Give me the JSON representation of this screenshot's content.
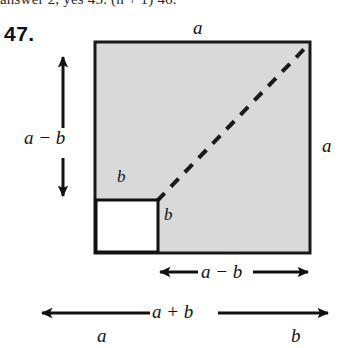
{
  "page": {
    "truncated_top_line": "answer 2, yes    45. (n + 1)     46.",
    "problem_number": "47."
  },
  "figure": {
    "title_top_label": "a",
    "right_label": "a",
    "left_vertical_label": "a − b",
    "inner_label_above_square": "b",
    "inner_label_right_of_square": "b",
    "bottom_inner_label": "a − b",
    "bottom_outer_label": "a + b",
    "bottom_segment_left_label": "a",
    "bottom_segment_right_label": "b",
    "colors": {
      "shaded_square_fill": "#d9d9d9",
      "shaded_square_stroke": "#1a1a1a",
      "inner_square_fill": "#ffffff",
      "inner_square_stroke": "#111111",
      "diagonal_dashed_stroke": "#1a1a1a",
      "arrow_stroke": "#101010",
      "text": "#111111"
    },
    "geometry": {
      "big_square": {
        "x": 95,
        "y": 42,
        "width": 215,
        "height": 211
      },
      "inner_white_square": {
        "x": 95,
        "y": 200,
        "width": 63,
        "height": 53
      },
      "diagonal": {
        "x1": 158,
        "y1": 200,
        "x2": 310,
        "y2": 42
      }
    },
    "icon_names": [
      "arrow-up-icon",
      "arrow-down-icon",
      "arrow-left-icon",
      "arrow-right-icon",
      "double-headed-arrow-icon",
      "dashed-diagonal-icon"
    ]
  }
}
